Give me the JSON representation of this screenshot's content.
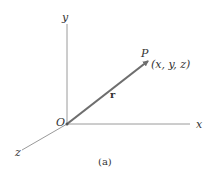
{
  "figure": {
    "caption": "(a)",
    "axes": {
      "x_label": "x",
      "y_label": "y",
      "z_label": "z",
      "origin_label": "O"
    },
    "vector": {
      "label": "r",
      "point_label": "P",
      "point_coords": "(x, y, z)"
    },
    "colors": {
      "axis": "#8a8a8a",
      "vector": "#6e6e6e",
      "text": "#333333"
    }
  }
}
